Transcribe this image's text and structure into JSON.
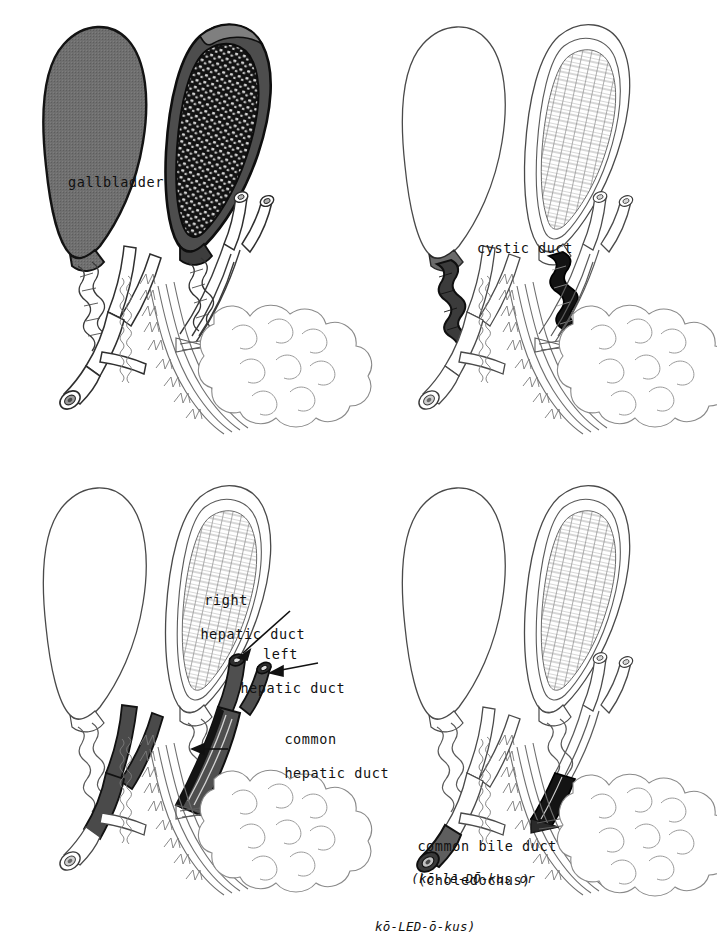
{
  "plate": {
    "title": "Biliary system — gallbladder and bile ducts",
    "background_color": "#ffffff",
    "ink_color": "#111111",
    "panel_count": 4,
    "layout": "2x2 grid"
  },
  "palette": {
    "ink": "#111111",
    "outline": "#3a3a3a",
    "faint_outline": "#6e6e6e",
    "highlight_gray": "#6b6b6b",
    "highlight_dark": "#474747",
    "highlight_black": "#151515",
    "mucosa_gray": "#8a8a8a",
    "paper": "#ffffff"
  },
  "panels": [
    {
      "id": "panel-gallbladder",
      "position": "top-left",
      "highlight_structure": "gallbladder",
      "highlight_color": "#6b6b6b",
      "label": {
        "text": "gallbladder",
        "x": 68,
        "y": 174
      },
      "figures": [
        "whole-gallbladder-with-duct-tree",
        "sectioned-gallbladder-with-duodenum-and-pancreas"
      ]
    },
    {
      "id": "panel-cystic-duct",
      "position": "top-right",
      "highlight_structure": "cystic duct",
      "highlight_color": "#5a5a5a",
      "label": {
        "text": "cystic duct",
        "x": 118,
        "y": 240
      },
      "figures": [
        "whole-gallbladder-with-duct-tree",
        "sectioned-gallbladder-with-duodenum-and-pancreas"
      ]
    },
    {
      "id": "panel-hepatic-ducts",
      "position": "bottom-left",
      "highlight_structure": "hepatic ducts",
      "highlight_color": "#4f4f4f",
      "labels": [
        {
          "id": "right-hepatic-duct",
          "lines": [
            "right",
            "hepatic duct"
          ],
          "x": 248,
          "y": 122,
          "align": "right"
        },
        {
          "id": "left-hepatic-duct",
          "lines": [
            "left",
            "hepatic duct"
          ],
          "x": 288,
          "y": 176,
          "align": "right"
        },
        {
          "id": "common-hepatic-duct",
          "lines": [
            "common",
            "hepatic duct"
          ],
          "x": 232,
          "y": 253,
          "align": "left"
        }
      ],
      "figures": [
        "whole-gallbladder-with-duct-tree",
        "sectioned-gallbladder-with-duodenum-and-pancreas"
      ]
    },
    {
      "id": "panel-bile-duct",
      "position": "bottom-right",
      "highlight_structure": "common bile duct",
      "highlight_color": "#5e5e5e",
      "label": {
        "line1": "common bile duct",
        "line2": "(choledochus)",
        "pronunciation_line1": "(kō-le-DŌ-kus or",
        "pronunciation_line2": "kō-LED-ō-kus)",
        "x": 8,
        "y": 362
      },
      "figures": [
        "whole-gallbladder-with-duct-tree",
        "sectioned-gallbladder-with-duodenum-and-pancreas"
      ]
    }
  ],
  "structures": [
    "gallbladder",
    "cystic duct",
    "right hepatic duct",
    "left hepatic duct",
    "common hepatic duct",
    "common bile duct",
    "duodenum",
    "pancreas",
    "pancreatic duct",
    "mucosal folds"
  ]
}
